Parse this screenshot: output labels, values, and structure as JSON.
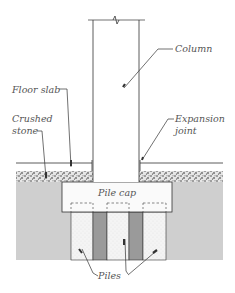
{
  "diagram": {
    "labels": {
      "column": "Column",
      "floor_slab": "Floor slab",
      "crushed_stone_1": "Crushed",
      "crushed_stone_2": "stone",
      "expansion_joint_1": "Expansion",
      "expansion_joint_2": "joint",
      "pile_cap": "Pile cap",
      "piles": "Piles"
    },
    "colors": {
      "line": "#333333",
      "ground": "#cfcfcf",
      "dark_pile": "#9a9a9a",
      "light_pile": "#f2f2f2",
      "gravel": "#888888",
      "text": "#555555"
    }
  }
}
